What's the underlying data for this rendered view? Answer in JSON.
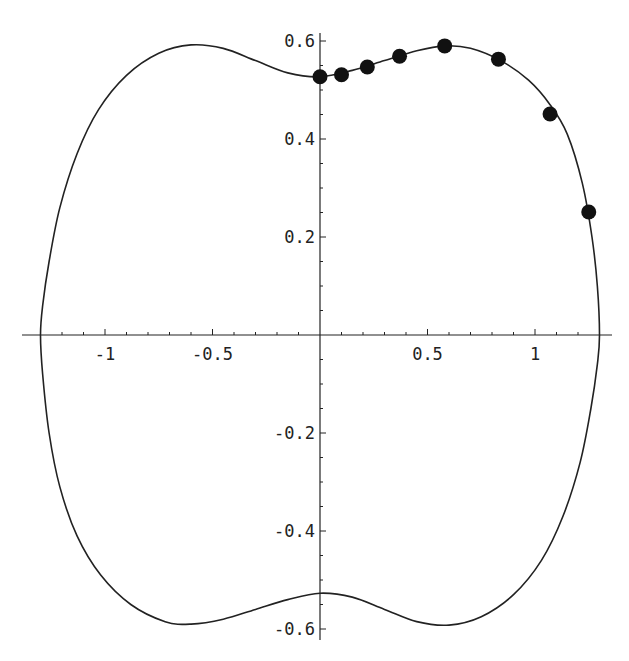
{
  "chart_data": {
    "type": "scatter",
    "title": "",
    "xlabel": "",
    "ylabel": "",
    "xlim": [
      -1.3,
      1.35
    ],
    "ylim": [
      -0.62,
      0.62
    ],
    "grid": false,
    "x_ticks": [
      {
        "value": -1,
        "label": "-1"
      },
      {
        "value": -0.5,
        "label": "-0.5"
      },
      {
        "value": 0.5,
        "label": "0.5"
      },
      {
        "value": 1,
        "label": "1"
      }
    ],
    "y_ticks": [
      {
        "value": 0.6,
        "label": "0.6"
      },
      {
        "value": 0.4,
        "label": "0.4"
      },
      {
        "value": 0.2,
        "label": "0.2"
      },
      {
        "value": -0.2,
        "label": "-0.2"
      },
      {
        "value": -0.4,
        "label": "-0.4"
      },
      {
        "value": -0.6,
        "label": "-0.6"
      }
    ],
    "series": [
      {
        "name": "closed curve",
        "kind": "line",
        "color": "#222222",
        "points": [
          [
            1.3,
            0
          ],
          [
            1.29,
            0.1
          ],
          [
            1.265,
            0.2
          ],
          [
            1.22,
            0.31
          ],
          [
            1.15,
            0.41
          ],
          [
            1.07,
            0.47
          ],
          [
            0.97,
            0.52
          ],
          [
            0.84,
            0.56
          ],
          [
            0.7,
            0.585
          ],
          [
            0.58,
            0.59
          ],
          [
            0.45,
            0.58
          ],
          [
            0.3,
            0.56
          ],
          [
            0.15,
            0.54
          ],
          [
            0,
            0.527
          ],
          [
            -0.15,
            0.535
          ],
          [
            -0.3,
            0.56
          ],
          [
            -0.45,
            0.585
          ],
          [
            -0.6,
            0.592
          ],
          [
            -0.75,
            0.575
          ],
          [
            -0.9,
            0.53
          ],
          [
            -1.03,
            0.46
          ],
          [
            -1.13,
            0.37
          ],
          [
            -1.21,
            0.26
          ],
          [
            -1.26,
            0.15
          ],
          [
            -1.29,
            0.06
          ],
          [
            -1.3,
            0
          ],
          [
            -1.29,
            -0.08
          ],
          [
            -1.26,
            -0.2
          ],
          [
            -1.21,
            -0.31
          ],
          [
            -1.13,
            -0.41
          ],
          [
            -1.02,
            -0.49
          ],
          [
            -0.88,
            -0.55
          ],
          [
            -0.72,
            -0.585
          ],
          [
            -0.6,
            -0.59
          ],
          [
            -0.45,
            -0.58
          ],
          [
            -0.3,
            -0.56
          ],
          [
            -0.15,
            -0.54
          ],
          [
            0,
            -0.527
          ],
          [
            0.15,
            -0.535
          ],
          [
            0.3,
            -0.56
          ],
          [
            0.45,
            -0.585
          ],
          [
            0.6,
            -0.592
          ],
          [
            0.75,
            -0.575
          ],
          [
            0.9,
            -0.53
          ],
          [
            1.03,
            -0.46
          ],
          [
            1.13,
            -0.37
          ],
          [
            1.21,
            -0.26
          ],
          [
            1.26,
            -0.15
          ],
          [
            1.29,
            -0.06
          ],
          [
            1.3,
            0
          ]
        ]
      },
      {
        "name": "sample points",
        "kind": "markers",
        "color": "#111111",
        "points": [
          [
            0.0,
            0.527
          ],
          [
            0.1,
            0.531
          ],
          [
            0.22,
            0.547
          ],
          [
            0.37,
            0.569
          ],
          [
            0.58,
            0.59
          ],
          [
            0.83,
            0.563
          ],
          [
            1.07,
            0.451
          ],
          [
            1.25,
            0.251
          ]
        ]
      }
    ]
  }
}
